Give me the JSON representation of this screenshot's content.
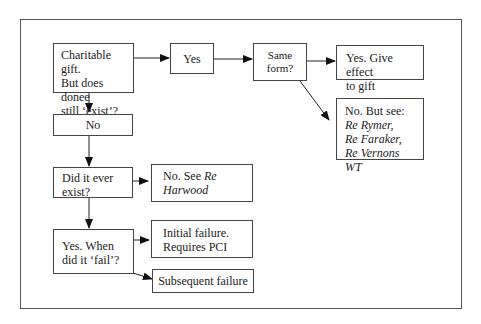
{
  "diagram": {
    "nodes": {
      "start": {
        "lines": [
          "Charitable gift.",
          "But does donee",
          "still ‘exist’?"
        ]
      },
      "yes": {
        "label": "Yes"
      },
      "same_form": {
        "lines": [
          "Same",
          "form?"
        ]
      },
      "give_effect": {
        "lines": [
          "Yes. Give effect",
          "to gift"
        ]
      },
      "no_but_see": {
        "line1": "No. But see:",
        "cases": [
          "Re Rymer,",
          "Re Faraker,",
          "Re Vernons WT"
        ]
      },
      "no": {
        "label": "No"
      },
      "ever_exist": {
        "lines": [
          "Did it ever",
          "exist?"
        ]
      },
      "harwood": {
        "line1": "No. See ",
        "case1": "Re",
        "case2": "Harwood"
      },
      "when_fail": {
        "lines": [
          "Yes. When",
          "did it ‘fail’?"
        ]
      },
      "initial": {
        "lines": [
          "Initial failure.",
          "Requires PCI"
        ]
      },
      "subsequent": {
        "label": "Subsequent failure"
      }
    }
  }
}
